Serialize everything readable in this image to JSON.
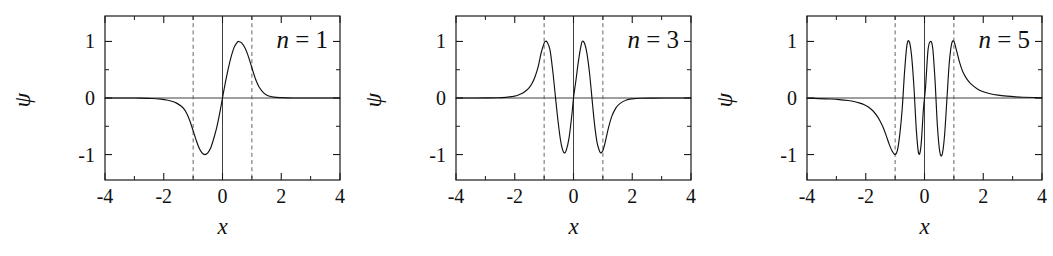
{
  "figure": {
    "background": "#ffffff",
    "curve_color": "#111111",
    "axis_color": "#1a1a1a",
    "turning_point_color": "#555555",
    "panel_count": 3
  },
  "chart_data": [
    {
      "type": "line",
      "title": "",
      "annotation": "n = 1",
      "annotation_symbol": "n",
      "annotation_relation": "=",
      "annotation_value": "1",
      "xlabel": "x",
      "ylabel": "ψ",
      "xlim": [
        -4,
        4
      ],
      "ylim": [
        -1.45,
        1.45
      ],
      "xticks": [
        -4,
        -2,
        0,
        2,
        4
      ],
      "xticklabels": [
        "-4",
        "-2",
        "0",
        "2",
        "4"
      ],
      "xminorticks": [
        -3,
        -1,
        1,
        3
      ],
      "yticks": [
        1,
        0,
        -1
      ],
      "yticklabels": [
        "1",
        "0",
        "-1"
      ],
      "yminorticks": [
        1.5,
        0.5,
        -0.5,
        -1.5
      ],
      "grid": false,
      "legend": "none",
      "zero_line": 0,
      "turning_points": [
        -1,
        1
      ],
      "parity": "odd",
      "nodes": [
        0
      ],
      "extrema": [
        {
          "x": -0.6,
          "y": -1.0
        },
        {
          "x": 0.55,
          "y": 1.0
        }
      ],
      "x": [
        -4.0,
        -3.6,
        -3.2,
        -2.8,
        -2.4,
        -2.1,
        -1.9,
        -1.7,
        -1.55,
        -1.4,
        -1.3,
        -1.2,
        -1.1,
        -1.0,
        -0.9,
        -0.8,
        -0.7,
        -0.6,
        -0.5,
        -0.4,
        -0.3,
        -0.2,
        -0.1,
        0.0,
        0.1,
        0.2,
        0.3,
        0.4,
        0.5,
        0.55,
        0.65,
        0.75,
        0.85,
        0.95,
        1.05,
        1.15,
        1.25,
        1.4,
        1.55,
        1.75,
        2.0,
        2.4,
        2.8,
        3.2,
        3.6,
        4.0
      ],
      "y": [
        0.0,
        0.0,
        0.0,
        -0.002,
        -0.008,
        -0.02,
        -0.035,
        -0.062,
        -0.095,
        -0.145,
        -0.2,
        -0.29,
        -0.42,
        -0.58,
        -0.74,
        -0.88,
        -0.97,
        -1.0,
        -0.97,
        -0.88,
        -0.72,
        -0.53,
        -0.28,
        0.0,
        0.28,
        0.53,
        0.74,
        0.9,
        0.985,
        1.0,
        0.975,
        0.9,
        0.78,
        0.62,
        0.45,
        0.3,
        0.19,
        0.09,
        0.04,
        0.015,
        0.006,
        0.0,
        0.0,
        0.0,
        0.0,
        0.0
      ]
    },
    {
      "type": "line",
      "title": "",
      "annotation": "n = 3",
      "annotation_symbol": "n",
      "annotation_relation": "=",
      "annotation_value": "3",
      "xlabel": "x",
      "ylabel": "ψ",
      "xlim": [
        -4,
        4
      ],
      "ylim": [
        -1.45,
        1.45
      ],
      "xticks": [
        -4,
        -2,
        0,
        2,
        4
      ],
      "xticklabels": [
        "-4",
        "-2",
        "0",
        "2",
        "4"
      ],
      "xminorticks": [
        -3,
        -1,
        1,
        3
      ],
      "yticks": [
        1,
        0,
        -1
      ],
      "yticklabels": [
        "1",
        "0",
        "-1"
      ],
      "yminorticks": [
        1.5,
        0.5,
        -0.5,
        -1.5
      ],
      "grid": false,
      "legend": "none",
      "zero_line": 0,
      "turning_points": [
        -1,
        1
      ],
      "parity": "odd",
      "nodes": [
        -0.65,
        0,
        0.65
      ],
      "extrema": [
        {
          "x": -0.95,
          "y": 1.0
        },
        {
          "x": -0.32,
          "y": -0.97
        },
        {
          "x": 0.3,
          "y": 1.0
        },
        {
          "x": 0.92,
          "y": -0.97
        }
      ],
      "x": [
        -4.0,
        -3.5,
        -3.0,
        -2.6,
        -2.3,
        -2.1,
        -1.95,
        -1.8,
        -1.65,
        -1.5,
        -1.4,
        -1.3,
        -1.2,
        -1.1,
        -1.0,
        -0.95,
        -0.9,
        -0.8,
        -0.7,
        -0.65,
        -0.55,
        -0.45,
        -0.38,
        -0.32,
        -0.25,
        -0.15,
        -0.05,
        0.0,
        0.08,
        0.16,
        0.24,
        0.3,
        0.38,
        0.46,
        0.55,
        0.65,
        0.72,
        0.8,
        0.86,
        0.92,
        1.0,
        1.08,
        1.18,
        1.3,
        1.45,
        1.6,
        1.8,
        2.0,
        2.3,
        2.7,
        3.1,
        3.5,
        4.0
      ],
      "y": [
        0.0,
        0.0,
        0.001,
        0.004,
        0.012,
        0.025,
        0.04,
        0.07,
        0.115,
        0.19,
        0.27,
        0.39,
        0.56,
        0.8,
        0.97,
        1.0,
        0.99,
        0.85,
        0.45,
        0.2,
        -0.3,
        -0.72,
        -0.9,
        -0.97,
        -0.93,
        -0.7,
        -0.27,
        0.0,
        0.3,
        0.62,
        0.88,
        1.0,
        0.96,
        0.78,
        0.42,
        -0.12,
        -0.48,
        -0.78,
        -0.9,
        -0.97,
        -0.93,
        -0.78,
        -0.55,
        -0.33,
        -0.17,
        -0.09,
        -0.035,
        -0.015,
        -0.004,
        -0.001,
        0.0,
        0.0,
        0.0
      ]
    },
    {
      "type": "line",
      "title": "",
      "annotation": "n = 5",
      "annotation_symbol": "n",
      "annotation_relation": "=",
      "annotation_value": "5",
      "xlabel": "x",
      "ylabel": "ψ",
      "xlim": [
        -4,
        4
      ],
      "ylim": [
        -1.45,
        1.45
      ],
      "xticks": [
        -4,
        -2,
        0,
        2,
        4
      ],
      "xticklabels": [
        "-4",
        "-2",
        "0",
        "2",
        "4"
      ],
      "xminorticks": [
        -3,
        -1,
        1,
        3
      ],
      "yticks": [
        1,
        0,
        -1
      ],
      "yticklabels": [
        "1",
        "0",
        "-1"
      ],
      "yminorticks": [
        1.5,
        0.5,
        -0.5,
        -1.5
      ],
      "grid": false,
      "legend": "none",
      "zero_line": 0,
      "turning_points": [
        -1,
        1
      ],
      "parity": "even",
      "nodes": [
        -0.8,
        -0.4,
        0.0,
        0.4,
        0.8
      ],
      "extrema": [
        {
          "x": -1.0,
          "y": -1.0
        },
        {
          "x": -0.6,
          "y": 1.0
        },
        {
          "x": -0.2,
          "y": -1.0
        },
        {
          "x": 0.2,
          "y": 1.0
        },
        {
          "x": 0.6,
          "y": -1.0
        },
        {
          "x": 1.0,
          "y": 1.0
        }
      ],
      "x": [
        -4.0,
        -3.6,
        -3.2,
        -2.9,
        -2.6,
        -2.4,
        -2.2,
        -2.05,
        -1.9,
        -1.75,
        -1.6,
        -1.5,
        -1.4,
        -1.3,
        -1.2,
        -1.1,
        -1.0,
        -0.92,
        -0.84,
        -0.76,
        -0.68,
        -0.6,
        -0.52,
        -0.44,
        -0.36,
        -0.28,
        -0.2,
        -0.12,
        -0.04,
        0.0,
        0.04,
        0.12,
        0.2,
        0.28,
        0.36,
        0.44,
        0.52,
        0.6,
        0.68,
        0.76,
        0.84,
        0.92,
        1.0,
        1.1,
        1.2,
        1.3,
        1.45,
        1.6,
        1.8,
        2.0,
        2.2,
        2.5,
        2.8,
        3.1,
        3.4,
        3.7,
        4.0
      ],
      "y": [
        -0.005,
        -0.01,
        -0.018,
        -0.028,
        -0.045,
        -0.062,
        -0.09,
        -0.12,
        -0.165,
        -0.23,
        -0.33,
        -0.42,
        -0.53,
        -0.67,
        -0.82,
        -0.94,
        -1.0,
        -0.92,
        -0.64,
        -0.2,
        0.45,
        0.93,
        1.0,
        0.75,
        0.2,
        -0.55,
        -0.98,
        -0.85,
        -0.22,
        0.0,
        0.22,
        0.85,
        1.0,
        0.88,
        0.3,
        -0.5,
        -0.95,
        -1.0,
        -0.68,
        -0.05,
        0.6,
        0.95,
        1.0,
        0.82,
        0.62,
        0.47,
        0.33,
        0.24,
        0.16,
        0.11,
        0.08,
        0.05,
        0.032,
        0.02,
        0.013,
        0.008,
        0.005
      ]
    }
  ]
}
